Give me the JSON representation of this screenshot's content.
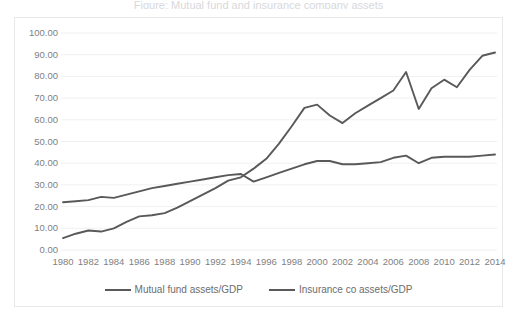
{
  "chart": {
    "title_ghost": "Figure: Mutual fund and insurance company assets",
    "frame_border_color": "#e8e8e8",
    "gridline_color": "#f0f0f0",
    "axis_label_color": "#7f7f7f",
    "series_color": "#595959"
  },
  "legend": {
    "position": "bottom",
    "items": [
      {
        "label": "Mutual fund assets/GDP",
        "color": "#595959"
      },
      {
        "label": "Insurance co assets/GDP",
        "color": "#595959"
      }
    ]
  },
  "yaxis": {
    "ticks": [
      "100.00",
      "90.00",
      "80.00",
      "70.00",
      "60.00",
      "50.00",
      "40.00",
      "30.00",
      "20.00",
      "10.00",
      "0.00"
    ]
  },
  "xaxis": {
    "ticks": [
      "1980",
      "1982",
      "1984",
      "1986",
      "1988",
      "1990",
      "1992",
      "1994",
      "1996",
      "1998",
      "2000",
      "2002",
      "2004",
      "2006",
      "2008",
      "2010",
      "2012",
      "2014"
    ]
  },
  "chart_data": {
    "type": "line",
    "title": "",
    "xlabel": "",
    "ylabel": "",
    "ylim": [
      0,
      100
    ],
    "xlim": [
      1980,
      2014
    ],
    "grid": true,
    "legend_position": "bottom",
    "x": [
      1980,
      1981,
      1982,
      1983,
      1984,
      1985,
      1986,
      1987,
      1988,
      1989,
      1990,
      1991,
      1992,
      1993,
      1994,
      1995,
      1996,
      1997,
      1998,
      1999,
      2000,
      2001,
      2002,
      2003,
      2004,
      2005,
      2006,
      2007,
      2008,
      2009,
      2010,
      2011,
      2012,
      2013,
      2014
    ],
    "series": [
      {
        "name": "Mutual fund assets/GDP",
        "color": "#595959",
        "values": [
          5.5,
          7.5,
          9.0,
          8.5,
          10.0,
          13.0,
          15.5,
          16.0,
          17.0,
          19.5,
          22.5,
          25.5,
          28.5,
          32.0,
          33.5,
          37.5,
          42.0,
          49.0,
          57.0,
          65.5,
          67.0,
          62.0,
          58.5,
          63.0,
          66.5,
          70.0,
          73.5,
          82.0,
          65.0,
          74.5,
          78.5,
          75.0,
          83.0,
          89.5,
          91.0
        ]
      },
      {
        "name": "Insurance co assets/GDP",
        "color": "#595959",
        "values": [
          22.0,
          22.5,
          23.0,
          24.5,
          24.0,
          25.5,
          27.0,
          28.5,
          29.5,
          30.5,
          31.5,
          32.5,
          33.5,
          34.5,
          35.0,
          31.5,
          33.5,
          35.5,
          37.5,
          39.5,
          41.0,
          41.0,
          39.5,
          39.5,
          40.0,
          40.5,
          42.5,
          43.5,
          40.0,
          42.5,
          43.0,
          43.0,
          43.0,
          43.5,
          44.0
        ]
      }
    ]
  }
}
